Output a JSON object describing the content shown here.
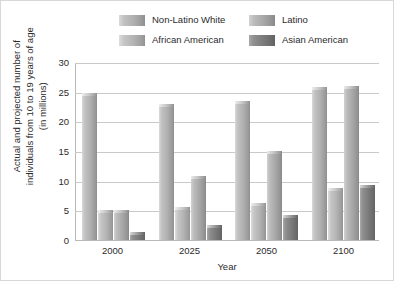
{
  "chart_data": {
    "type": "bar",
    "title": "",
    "xlabel": "Year",
    "ylabel": "Actual and projected number of individuals from 10 to 19 years of age (in millions)",
    "categories": [
      "2000",
      "2025",
      "2050",
      "2100"
    ],
    "series": [
      {
        "name": "Non-Latino White",
        "color": "#b0b0b0",
        "values": [
          24.8,
          23.0,
          23.5,
          25.8
        ]
      },
      {
        "name": "African American",
        "color": "#b4b4b4",
        "values": [
          5.0,
          5.5,
          6.3,
          8.8
        ]
      },
      {
        "name": "Latino",
        "color": "#a8a8a8",
        "values": [
          5.0,
          10.8,
          15.0,
          25.9
        ]
      },
      {
        "name": "Asian American",
        "color": "#7b7b7b",
        "values": [
          1.3,
          2.5,
          4.3,
          9.3
        ]
      }
    ],
    "ylim": [
      0,
      30
    ],
    "yticks": [
      "0",
      "5",
      "10",
      "15",
      "20",
      "25",
      "30"
    ],
    "ytick_values": [
      0,
      5,
      10,
      15,
      20,
      25,
      30
    ],
    "grid": true,
    "legend_position": "top"
  },
  "ylabel_lines": [
    "Actual and projected number of",
    "individuals from 10 to 19 years of age",
    "(in millions)"
  ]
}
